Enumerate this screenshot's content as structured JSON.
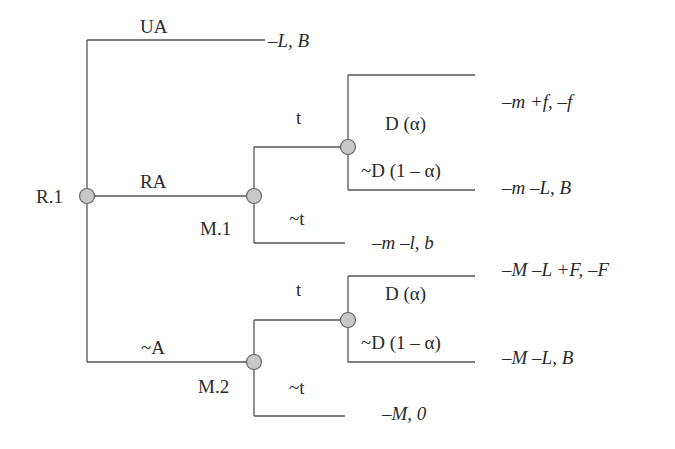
{
  "diagram": {
    "type": "game-tree",
    "nodes": {
      "root": "R.1",
      "m1": "M.1",
      "m2": "M.2"
    },
    "edges": {
      "ua": "UA",
      "ra": "RA",
      "na": "~A",
      "m1_t": "t",
      "m1_nt": "~t",
      "m2_t": "t",
      "m2_nt": "~t",
      "d1_d": "D (α)",
      "d1_nd": "~D (1 – α)",
      "d2_d": "D (α)",
      "d2_nd": "~D (1 – α)"
    },
    "payoffs": {
      "ua": "–L, B",
      "d1_d": "–m +f, –f",
      "d1_nd": "–m –L, B",
      "m1_nt": "–m –l, b",
      "d2_d": "–M –L +F, –F",
      "d2_nd": "–M –L, B",
      "m2_nt": "–M, 0"
    },
    "colors": {
      "line": "#555555",
      "node_fill": "#c8c8c8",
      "text": "#2a2a2a"
    }
  }
}
